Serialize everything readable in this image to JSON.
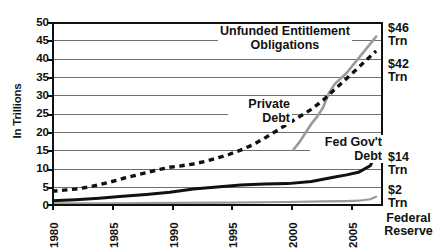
{
  "chart_data": {
    "type": "line",
    "title": "",
    "xlabel": "",
    "ylabel": "In Trillions",
    "xlim": [
      1980,
      2008
    ],
    "ylim": [
      0,
      50
    ],
    "grid": true,
    "legend_position": "inline-annotations",
    "y_ticks": [
      "0",
      "5",
      "10",
      "15",
      "20",
      "25",
      "30",
      "35",
      "40",
      "45",
      "50"
    ],
    "x_ticks": [
      "1980",
      "1985",
      "1990",
      "1995",
      "2000",
      "2005"
    ],
    "series": [
      {
        "name": "Unfunded Entitlement Obligations",
        "style": "solid-gray",
        "color": "#9a9a9a",
        "x": [
          2000.5,
          2001,
          2001.5,
          2002,
          2002.5,
          2003,
          2003.5,
          2004,
          2004.5,
          2005,
          2005.5,
          2006,
          2006.5,
          2007,
          2007.5
        ],
        "values": [
          15.0,
          17.0,
          19.5,
          22.0,
          24.0,
          26.5,
          30.5,
          33.0,
          34.5,
          36.0,
          38.0,
          40.0,
          42.0,
          44.0,
          46.0
        ],
        "end_label": "$46 Trn"
      },
      {
        "name": "Private Debt",
        "style": "dashed-black",
        "color": "#111111",
        "x": [
          1980,
          1981,
          1982,
          1983,
          1984,
          1985,
          1986,
          1987,
          1988,
          1989,
          1990,
          1991,
          1992,
          1993,
          1994,
          1995,
          1996,
          1997,
          1998,
          1999,
          2000,
          2001,
          2002,
          2003,
          2004,
          2005,
          2006,
          2007,
          2007.5
        ],
        "values": [
          3.5,
          3.8,
          4.1,
          4.6,
          5.3,
          6.1,
          7.0,
          7.8,
          8.6,
          9.4,
          10.1,
          10.5,
          11.0,
          11.7,
          12.6,
          13.6,
          14.8,
          16.2,
          18.0,
          20.0,
          22.0,
          24.0,
          26.0,
          28.5,
          31.5,
          34.5,
          37.5,
          40.5,
          42.0
        ],
        "end_label": "$42 Trn"
      },
      {
        "name": "Fed Gov't Debt",
        "style": "solid-black",
        "color": "#111111",
        "x": [
          1980,
          1982,
          1984,
          1986,
          1988,
          1990,
          1992,
          1994,
          1996,
          1998,
          2000,
          2002,
          2004,
          2005,
          2006,
          2007,
          2007.5
        ],
        "values": [
          0.9,
          1.2,
          1.6,
          2.1,
          2.6,
          3.2,
          4.1,
          4.7,
          5.2,
          5.5,
          5.6,
          6.2,
          7.4,
          8.0,
          8.7,
          10.5,
          14.0
        ],
        "end_label": "$14 Trn"
      },
      {
        "name": "Federal Reserve",
        "style": "solid-gray-thin",
        "color": "#9a9a9a",
        "x": [
          1980,
          1985,
          1990,
          1995,
          2000,
          2003,
          2005,
          2006,
          2007,
          2007.5
        ],
        "values": [
          0.15,
          0.2,
          0.3,
          0.4,
          0.55,
          0.7,
          0.8,
          0.9,
          1.3,
          2.0
        ],
        "end_label": "$2 Trn"
      }
    ],
    "annotations": [
      {
        "id": "unfunded",
        "lines": [
          "Unfunded Entitlement",
          "Obligations"
        ]
      },
      {
        "id": "private",
        "lines": [
          "Private",
          "Debt"
        ]
      },
      {
        "id": "fedgov",
        "lines": [
          "Fed Gov't",
          "Debt"
        ]
      }
    ],
    "right_labels": [
      {
        "id": "r46",
        "value": "$46",
        "unit": "Trn"
      },
      {
        "id": "r42",
        "value": "$42",
        "unit": "Trn"
      },
      {
        "id": "r14",
        "value": "$14",
        "unit": "Trn"
      },
      {
        "id": "r2",
        "value": "$2",
        "unit": "Trn"
      },
      {
        "id": "rfed",
        "line1": "Federal",
        "line2": "Reserve"
      }
    ]
  },
  "colors": {
    "axis": "#111111",
    "grid": "#6f6f6f",
    "gray_series": "#9a9a9a",
    "background": "#ffffff"
  }
}
